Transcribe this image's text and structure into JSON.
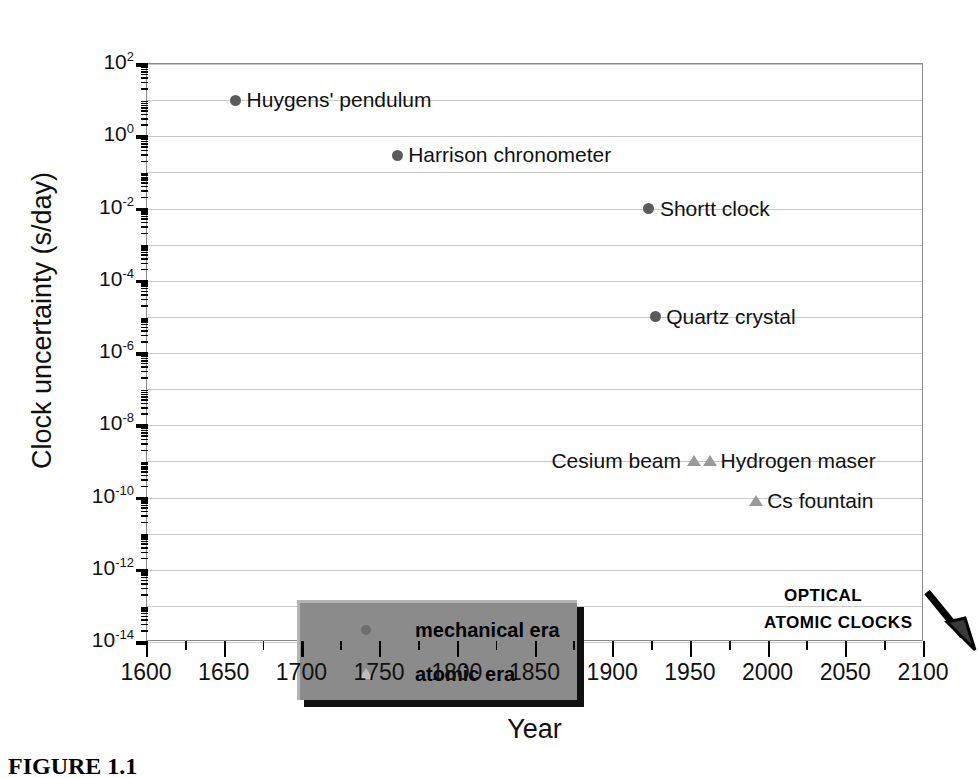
{
  "chart_data": {
    "type": "scatter",
    "title": "",
    "xlabel": "Year",
    "ylabel": "Clock uncertainty (s/day)",
    "xlim": [
      1600,
      2100
    ],
    "ylim": [
      1e-14,
      100.0
    ],
    "yscale": "log",
    "grid": true,
    "xticks": [
      1600,
      1650,
      1700,
      1750,
      1800,
      1850,
      1900,
      1950,
      2000,
      2050,
      2100
    ],
    "xticklabels": [
      "1600",
      "1650",
      "1700",
      "1750",
      "1800",
      "1850",
      "1900",
      "1950",
      "2000",
      "2050",
      "2100"
    ],
    "yticks": [
      100,
      1,
      0.01,
      0.0001,
      1e-06,
      1e-08,
      1e-10,
      1e-12,
      1e-14
    ],
    "yticklabels": [
      "10²",
      "10⁰",
      "10⁻²",
      "10⁻⁴",
      "10⁻⁶",
      "10⁻⁸",
      "10⁻¹⁰",
      "10⁻¹²",
      "10⁻¹⁴"
    ],
    "yexponents": [
      2,
      0,
      -2,
      -4,
      -6,
      -8,
      -10,
      -12,
      -14
    ],
    "series": [
      {
        "name": "mechanical era",
        "marker": "circle",
        "color": "#5b5b5b",
        "points": [
          {
            "label": "Huygens' pendulum",
            "x": 1657,
            "y": 10,
            "label_side": "right"
          },
          {
            "label": "Harrison chronometer",
            "x": 1761,
            "y": 0.3,
            "label_side": "right"
          },
          {
            "label": "Shortt clock",
            "x": 1923,
            "y": 0.01,
            "label_side": "right"
          },
          {
            "label": "Quartz crystal",
            "x": 1927,
            "y": 1e-05,
            "label_side": "right"
          }
        ]
      },
      {
        "name": "atomic era",
        "marker": "triangle",
        "color": "#9a9a9a",
        "points": [
          {
            "label": "Cesium beam",
            "x": 1952,
            "y": 1e-09,
            "label_side": "left"
          },
          {
            "label": "Hydrogen maser",
            "x": 1962,
            "y": 1e-09,
            "label_side": "right"
          },
          {
            "label": "Cs fountain",
            "x": 1992,
            "y": 8e-11,
            "label_side": "right"
          }
        ]
      }
    ],
    "legend": {
      "position": "lower-left",
      "entries": [
        {
          "label": "mechanical era",
          "marker": "circle"
        },
        {
          "label": "atomic era",
          "marker": "triangle"
        }
      ]
    },
    "annotations": [
      {
        "name": "optical-clocks-arrow",
        "type": "arrow",
        "text_lines": [
          "OPTICAL",
          "ATOMIC CLOCKS"
        ]
      }
    ]
  },
  "annotation": {
    "line1": "OPTICAL",
    "line2": "ATOMIC CLOCKS"
  },
  "caption": {
    "text": "FIGURE 1.1"
  }
}
